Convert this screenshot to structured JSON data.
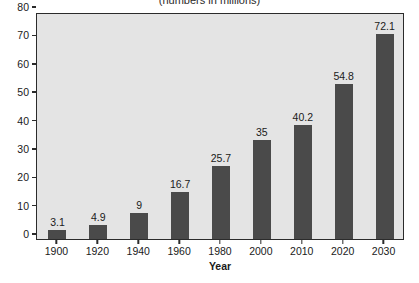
{
  "chart_data": {
    "type": "bar",
    "title": "(numbers in millions)",
    "xlabel": "Year",
    "ylabel": "",
    "categories": [
      "1900",
      "1920",
      "1940",
      "1960",
      "1980",
      "2000",
      "2010",
      "2020",
      "2030"
    ],
    "values": [
      3.1,
      4.9,
      9,
      16.7,
      25.7,
      35,
      40.2,
      54.8,
      72.1
    ],
    "value_labels": [
      "3.1",
      "4.9",
      "9",
      "16.7",
      "25.7",
      "35",
      "40.2",
      "54.8",
      "72.1"
    ],
    "ylim": [
      0,
      80
    ],
    "ytick_labels": [
      "0",
      "10",
      "20",
      "30",
      "40",
      "50",
      "60",
      "70",
      "80"
    ],
    "ytick_values": [
      0,
      10,
      20,
      30,
      40,
      50,
      60,
      70,
      80
    ],
    "grid": false,
    "legend": false,
    "bar_color": "#4a4a4a",
    "plot_background": "#e4e4e4",
    "page_background": "#ffffff",
    "axis_color": "#2b2b2b"
  }
}
